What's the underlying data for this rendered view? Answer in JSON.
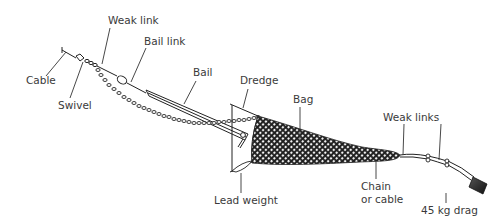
{
  "diagram": {
    "labels": {
      "weak_link": "Weak link",
      "bail_link": "Bail link",
      "cable": "Cable",
      "swivel": "Swivel",
      "bail": "Bail",
      "dredge": "Dredge",
      "bag": "Bag",
      "weak_links": "Weak links",
      "lead_weight": "Lead weight",
      "chain_or_cable_line1": "Chain",
      "chain_or_cable_line2": "or cable",
      "drag": "45 kg drag"
    },
    "colors": {
      "ink": "#222222",
      "label": "#3a3a3a",
      "background": "#ffffff",
      "drag_fill": "#333333"
    }
  }
}
